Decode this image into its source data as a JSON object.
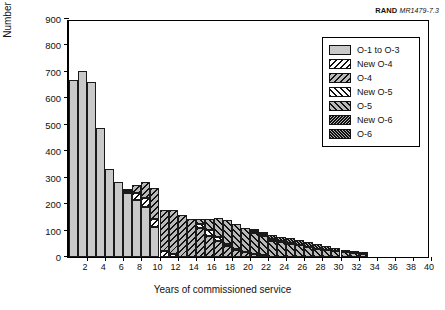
{
  "credit": {
    "org": "RAND",
    "figure_id": "MR1479-7.3"
  },
  "axes": {
    "ylabel": "Number of officers",
    "xlabel": "Years of commissioned service",
    "yticks": [
      0,
      100,
      200,
      300,
      400,
      500,
      600,
      700,
      800,
      900
    ],
    "xticks": [
      2,
      4,
      6,
      8,
      10,
      12,
      14,
      16,
      18,
      20,
      22,
      24,
      26,
      28,
      30,
      32,
      34,
      36,
      38,
      40
    ]
  },
  "legend": {
    "items": [
      {
        "label": "O-1 to O-3",
        "key": "o13",
        "color": "#c9c9c9",
        "pattern": "solid"
      },
      {
        "label": "New O-4",
        "key": "newo4",
        "color": "#ffffff",
        "pattern": "backslash"
      },
      {
        "label": "O-4",
        "key": "o4",
        "color": "#b9b9b9",
        "pattern": "backslash"
      },
      {
        "label": "New O-5",
        "key": "newo5",
        "color": "#ffffff",
        "pattern": "slash"
      },
      {
        "label": "O-5",
        "key": "o5",
        "color": "#b9b9b9",
        "pattern": "slash"
      },
      {
        "label": "New O-6",
        "key": "newo6",
        "color": "#b0b0b0",
        "pattern": "dense-backslash"
      },
      {
        "label": "O-6",
        "key": "o6",
        "color": "#b0b0b0",
        "pattern": "dense-slash"
      }
    ]
  },
  "chart_data": {
    "type": "bar",
    "stacked": true,
    "title": "",
    "xlabel": "Years of commissioned service",
    "ylabel": "Number of officers",
    "xlim": [
      0,
      40
    ],
    "ylim": [
      0,
      900
    ],
    "grid": false,
    "legend_position": "top-right",
    "categories": [
      1,
      2,
      3,
      4,
      5,
      6,
      7,
      8,
      9,
      10,
      11,
      12,
      13,
      14,
      15,
      16,
      17,
      18,
      19,
      20,
      21,
      22,
      23,
      24,
      25,
      26,
      27,
      28,
      29,
      30,
      31,
      32,
      33
    ],
    "series": [
      {
        "name": "O-1 to O-3",
        "key": "o13",
        "values": [
          670,
          702,
          660,
          487,
          333,
          282,
          242,
          215,
          188,
          115,
          0,
          0,
          0,
          0,
          0,
          0,
          0,
          0,
          0,
          0,
          0,
          0,
          0,
          0,
          0,
          0,
          0,
          0,
          0,
          0,
          0,
          0,
          0
        ]
      },
      {
        "name": "New O-4",
        "key": "newo4",
        "values": [
          0,
          0,
          0,
          0,
          0,
          0,
          8,
          28,
          34,
          30,
          22,
          10,
          0,
          0,
          0,
          0,
          0,
          0,
          0,
          0,
          0,
          0,
          0,
          0,
          0,
          0,
          0,
          0,
          0,
          0,
          0,
          0,
          0
        ]
      },
      {
        "name": "O-4",
        "key": "o4",
        "values": [
          0,
          0,
          0,
          0,
          0,
          0,
          5,
          30,
          60,
          115,
          155,
          168,
          160,
          145,
          110,
          80,
          60,
          42,
          28,
          18,
          10,
          6,
          0,
          0,
          0,
          0,
          0,
          0,
          0,
          0,
          0,
          0,
          0
        ]
      },
      {
        "name": "New O-5",
        "key": "newo5",
        "values": [
          0,
          0,
          0,
          0,
          0,
          0,
          0,
          0,
          0,
          0,
          0,
          0,
          0,
          0,
          16,
          22,
          14,
          8,
          4,
          0,
          0,
          0,
          0,
          0,
          0,
          0,
          0,
          0,
          0,
          0,
          0,
          0,
          0
        ]
      },
      {
        "name": "O-5",
        "key": "o5",
        "values": [
          0,
          0,
          0,
          0,
          0,
          0,
          0,
          0,
          0,
          0,
          0,
          0,
          0,
          0,
          16,
          43,
          72,
          90,
          92,
          90,
          82,
          72,
          62,
          55,
          50,
          44,
          38,
          32,
          26,
          22,
          18,
          14,
          10
        ]
      },
      {
        "name": "New O-6",
        "key": "newo6",
        "values": [
          0,
          0,
          0,
          0,
          0,
          0,
          0,
          0,
          0,
          0,
          0,
          0,
          0,
          0,
          0,
          0,
          0,
          0,
          0,
          0,
          5,
          9,
          8,
          6,
          4,
          2,
          0,
          0,
          0,
          0,
          0,
          0,
          0
        ]
      },
      {
        "name": "O-6",
        "key": "o6",
        "values": [
          0,
          0,
          0,
          0,
          0,
          0,
          0,
          0,
          0,
          0,
          0,
          0,
          0,
          0,
          0,
          0,
          0,
          0,
          0,
          0,
          2,
          6,
          12,
          16,
          18,
          18,
          17,
          16,
          14,
          12,
          10,
          8,
          6
        ]
      }
    ],
    "totals": [
      670,
      702,
      660,
      487,
      333,
      282,
      255,
      273,
      282,
      260,
      177,
      178,
      160,
      145,
      142,
      145,
      146,
      140,
      124,
      108,
      99,
      93,
      74,
      71,
      72,
      64,
      55,
      48,
      40,
      34,
      28,
      22,
      16
    ]
  }
}
